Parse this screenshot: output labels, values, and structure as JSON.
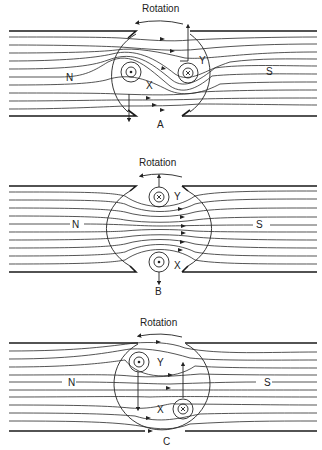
{
  "figure": {
    "panels": [
      {
        "id": "A",
        "label": "A",
        "title": "Rotation",
        "pole_left": "N",
        "pole_right": "S",
        "conductor_x": {
          "label": "X",
          "symbol": "dot"
        },
        "conductor_y": {
          "label": "Y",
          "symbol": "cross"
        }
      },
      {
        "id": "B",
        "label": "B",
        "title": "Rotation",
        "pole_left": "N",
        "pole_right": "S",
        "conductor_x": {
          "label": "X",
          "symbol": "dot"
        },
        "conductor_y": {
          "label": "Y",
          "symbol": "cross"
        }
      },
      {
        "id": "C",
        "label": "C",
        "title": "Rotation",
        "pole_left": "N",
        "pole_right": "S",
        "conductor_x": {
          "label": "X",
          "symbol": "cross"
        },
        "conductor_y": {
          "label": "Y",
          "symbol": "dot"
        }
      }
    ]
  }
}
